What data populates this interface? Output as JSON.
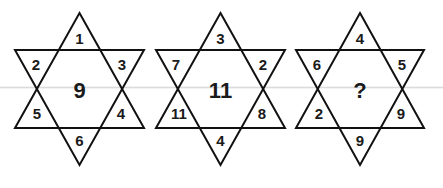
{
  "puzzle": {
    "type": "star-of-david number puzzle",
    "stars": [
      {
        "label": "star-1",
        "top": "1",
        "upper_left": "2",
        "upper_right": "3",
        "lower_left": "5",
        "lower_right": "4",
        "bottom": "6",
        "center": "9"
      },
      {
        "label": "star-2",
        "top": "3",
        "upper_left": "7",
        "upper_right": "2",
        "lower_left": "11",
        "lower_right": "8",
        "bottom": "4",
        "center": "11"
      },
      {
        "label": "star-3",
        "top": "4",
        "upper_left": "6",
        "upper_right": "5",
        "lower_left": "2",
        "lower_right": "9",
        "bottom": "9",
        "center": "?"
      }
    ]
  },
  "colors": {
    "line": "#111111",
    "text": "#1a1a1a",
    "background": "#ffffff"
  }
}
